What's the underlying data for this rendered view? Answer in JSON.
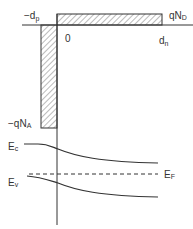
{
  "diagram": {
    "type": "pn-junction-charge-density-and-band-diagram",
    "charge_density": {
      "labels": {
        "neg_dp": {
          "main": "−d",
          "sub": "p"
        },
        "zero": "0",
        "dn": {
          "main": "d",
          "sub": "n"
        },
        "qND": {
          "main": "qN",
          "sub": "D"
        },
        "neg_qNA": {
          "main": "−qN",
          "sub": "A"
        }
      }
    },
    "band_diagram": {
      "labels": {
        "Ec": {
          "main": "E",
          "sub": "c"
        },
        "Ev": {
          "main": "E",
          "sub": "v"
        },
        "EF": {
          "main": "E",
          "sub": "F"
        }
      }
    },
    "colors": {
      "line": "#333333",
      "hatch": "#555555",
      "background": "#ffffff"
    }
  }
}
